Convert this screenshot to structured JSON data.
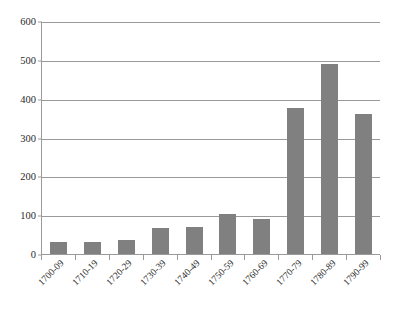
{
  "chart_data": {
    "type": "bar",
    "title": "",
    "subtitle": "",
    "xlabel": "",
    "ylabel": "",
    "categories": [
      "1700-09",
      "1710-19",
      "1720-29",
      "1730-39",
      "1740-49",
      "1750-59",
      "1760-69",
      "1770-79",
      "1780-89",
      "1790-99"
    ],
    "values": [
      30,
      32,
      37,
      68,
      70,
      103,
      90,
      375,
      490,
      360
    ],
    "ylim": [
      0,
      600
    ],
    "ytick_labels": [
      "0",
      "100",
      "200",
      "300",
      "400",
      "500",
      "600"
    ],
    "ytick_values": [
      0,
      100,
      200,
      300,
      400,
      500,
      600
    ],
    "grid": true,
    "legend": false,
    "legend_position": "none",
    "series": [
      {
        "name": "",
        "values": [
          30,
          32,
          37,
          68,
          70,
          103,
          90,
          375,
          490,
          360
        ]
      }
    ],
    "colors": {
      "bar_fill": "#808080",
      "gridline": "#9a9a9a",
      "axis": "#9a9a9a",
      "text": "#2b2b2b",
      "background": "#ffffff"
    }
  }
}
